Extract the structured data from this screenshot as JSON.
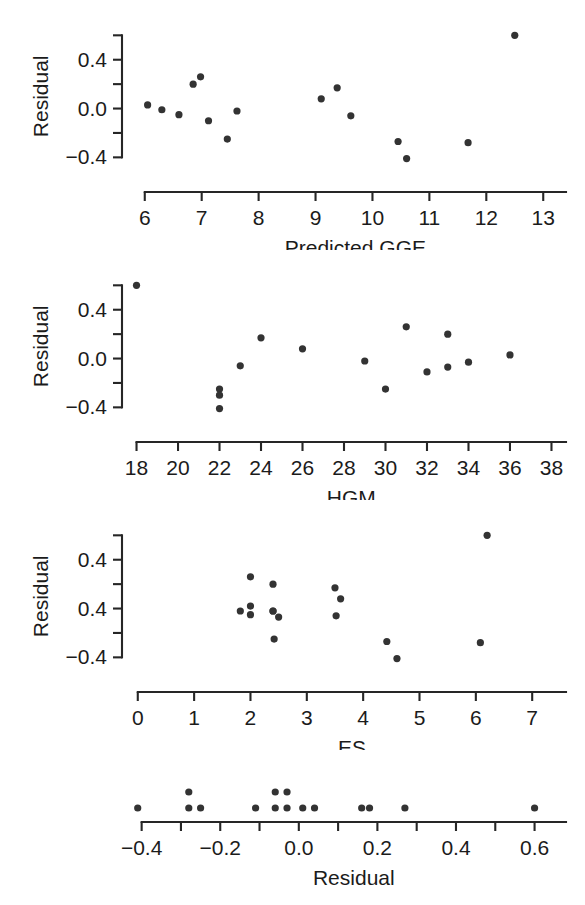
{
  "figure": {
    "background_color": "#ffffff",
    "ink_color": "#262626",
    "point_color": "#333333",
    "point_radius": 3.6
  },
  "chart_data": [
    {
      "id": "panel-predicted-gge",
      "type": "scatter",
      "title": "",
      "xlabel": "Predicted GGE",
      "ylabel": "Residual",
      "xlim": [
        5.6,
        13.4
      ],
      "ylim": [
        -0.52,
        0.66
      ],
      "xticks": [
        6,
        7,
        8,
        9,
        10,
        11,
        12,
        13
      ],
      "xtick_labels": [
        "6",
        "7",
        "8",
        "9",
        "10",
        "11",
        "12",
        "13"
      ],
      "yticks": [
        -0.4,
        -0.2,
        0.0,
        0.2,
        0.4,
        0.6
      ],
      "ytick_labels": [
        "-0.4",
        "",
        "0.0",
        "",
        "0.4",
        ""
      ],
      "grid": false,
      "legend": "none",
      "x": [
        6.05,
        6.3,
        6.6,
        6.85,
        6.98,
        7.12,
        7.45,
        7.62,
        9.1,
        9.38,
        9.62,
        10.45,
        10.6,
        11.68,
        12.5
      ],
      "y": [
        0.03,
        -0.01,
        -0.05,
        0.2,
        0.26,
        -0.1,
        -0.25,
        -0.02,
        0.08,
        0.17,
        -0.06,
        -0.27,
        -0.41,
        -0.28,
        0.6
      ]
    },
    {
      "id": "panel-hgm",
      "type": "scatter",
      "title": "",
      "xlabel": "HGM",
      "ylabel": "Residual",
      "xlim": [
        17.3,
        38.7
      ],
      "ylim": [
        -0.52,
        0.66
      ],
      "xticks": [
        18,
        20,
        22,
        24,
        26,
        28,
        30,
        32,
        34,
        36,
        38
      ],
      "xtick_labels": [
        "18",
        "20",
        "22",
        "24",
        "26",
        "28",
        "30",
        "32",
        "34",
        "36",
        "38"
      ],
      "yticks": [
        -0.4,
        -0.2,
        0.0,
        0.2,
        0.4,
        0.6
      ],
      "ytick_labels": [
        "-0.4",
        "",
        "0.0",
        "",
        "0.4",
        ""
      ],
      "grid": false,
      "legend": "none",
      "x": [
        18.0,
        22.0,
        22.0,
        22.0,
        23.0,
        24.0,
        26.0,
        29.0,
        30.0,
        31.0,
        32.0,
        33.0,
        33.0,
        34.0,
        36.0
      ],
      "y": [
        0.6,
        -0.25,
        -0.3,
        -0.41,
        -0.06,
        0.17,
        0.08,
        -0.02,
        -0.25,
        0.26,
        -0.11,
        -0.07,
        0.2,
        -0.03,
        0.03
      ]
    },
    {
      "id": "panel-es",
      "type": "scatter",
      "title": "",
      "xlabel": "ES",
      "ylabel": "Residual",
      "xlim": [
        -0.28,
        7.6
      ],
      "ylim": [
        -0.52,
        0.66
      ],
      "xticks": [
        0,
        1,
        2,
        3,
        4,
        5,
        6,
        7
      ],
      "xtick_labels": [
        "0",
        "1",
        "2",
        "3",
        "4",
        "5",
        "6",
        "7"
      ],
      "yticks": [
        -0.4,
        -0.2,
        0.0,
        0.2,
        0.4,
        0.6
      ],
      "ytick_labels": [
        "-0.4",
        "",
        "0.4",
        "",
        "0.4",
        ""
      ],
      "grid": false,
      "legend": "none",
      "x": [
        1.82,
        2.0,
        2.0,
        2.0,
        2.4,
        2.4,
        2.42,
        2.5,
        2.4,
        3.5,
        3.52,
        3.6,
        4.42,
        4.6,
        6.08,
        6.2
      ],
      "y": [
        -0.02,
        0.26,
        0.02,
        -0.05,
        0.2,
        -0.02,
        -0.25,
        -0.07,
        -0.02,
        0.17,
        -0.06,
        0.08,
        -0.27,
        -0.41,
        -0.28,
        0.6
      ]
    },
    {
      "id": "panel-residual-dotplot",
      "type": "scatter",
      "title": "",
      "xlabel": "Residual",
      "ylabel": "",
      "xlim": [
        -0.45,
        0.68
      ],
      "ylim": [
        0,
        4
      ],
      "xticks": [
        -0.4,
        -0.3,
        -0.2,
        -0.1,
        0.0,
        0.1,
        0.2,
        0.3,
        0.4,
        0.5,
        0.6
      ],
      "xtick_labels": [
        "-0.4",
        "",
        "-0.2",
        "",
        "0.0",
        "",
        "0.2",
        "",
        "0.4",
        "",
        "0.6"
      ],
      "grid": false,
      "legend": "none",
      "values": [
        -0.41,
        -0.28,
        -0.28,
        -0.25,
        -0.11,
        -0.07,
        -0.06,
        -0.06,
        -0.05,
        -0.03,
        -0.02,
        -0.02,
        0.02,
        0.03,
        0.03,
        0.08,
        0.17,
        0.2,
        0.26,
        0.6
      ],
      "dots": [
        {
          "x": -0.41,
          "stack": 1
        },
        {
          "x": -0.28,
          "stack": 1
        },
        {
          "x": -0.28,
          "stack": 2
        },
        {
          "x": -0.25,
          "stack": 1
        },
        {
          "x": -0.11,
          "stack": 1
        },
        {
          "x": -0.06,
          "stack": 1
        },
        {
          "x": -0.06,
          "stack": 2
        },
        {
          "x": -0.03,
          "stack": 1
        },
        {
          "x": -0.03,
          "stack": 2
        },
        {
          "x": 0.01,
          "stack": 1
        },
        {
          "x": 0.04,
          "stack": 1
        },
        {
          "x": 0.16,
          "stack": 1
        },
        {
          "x": 0.18,
          "stack": 1
        },
        {
          "x": 0.27,
          "stack": 1
        },
        {
          "x": 0.6,
          "stack": 1
        }
      ]
    }
  ]
}
